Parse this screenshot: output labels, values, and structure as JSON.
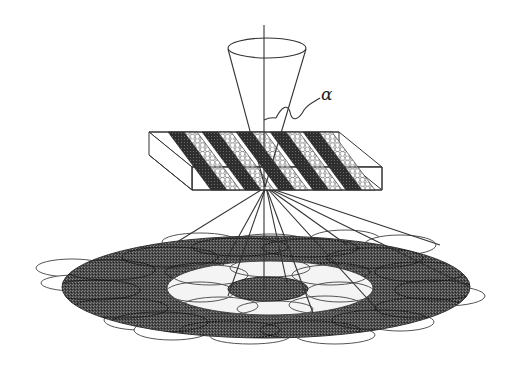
{
  "figure": {
    "type": "schematic",
    "labels": {
      "alpha": "α"
    },
    "colors": {
      "line": "#3a3a3a",
      "dark_fill": "#3c3c3c",
      "light_fill": "#f2f2f2",
      "background": "#ffffff"
    },
    "components": {
      "beam_cone": "incident convergent cone",
      "optical_axis": "vertical axis line",
      "crystal_slab": {
        "dark_stripes": 5,
        "honeycomb_stripes": 5
      },
      "diffraction_disc": {
        "outer_ring": "dark annulus of overlapping ellipses",
        "inner_ring": "light annulus of overlapping ellipses",
        "center": "dark central spot"
      },
      "diffracted_rays": 9
    }
  }
}
